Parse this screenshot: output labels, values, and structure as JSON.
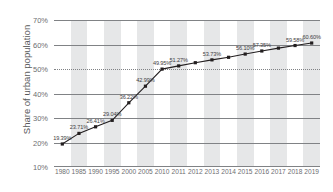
{
  "chart_data": {
    "type": "line",
    "title": "",
    "xlabel": "",
    "ylabel": "Share of urban population",
    "ylim": [
      10,
      70
    ],
    "y_ticks": [
      "10%",
      "20%",
      "30%",
      "40%",
      "50%",
      "60%",
      "70%"
    ],
    "y_tick_values": [
      10,
      20,
      30,
      40,
      50,
      60,
      70
    ],
    "grid": true,
    "legend": "none",
    "categories": [
      "1980",
      "1985",
      "1990",
      "1995",
      "2000",
      "2005",
      "2010",
      "2011",
      "2012",
      "2013",
      "2014",
      "2015",
      "2016",
      "2017",
      "2018",
      "2019"
    ],
    "values": [
      19.39,
      23.71,
      26.41,
      29.04,
      36.22,
      42.99,
      49.95,
      51.27,
      52.57,
      53.73,
      54.77,
      56.1,
      57.35,
      58.52,
      59.58,
      60.6
    ],
    "point_labels": [
      "19.39%",
      "23.71%",
      "26.41%",
      "29.04%",
      "36.22%",
      "42.99%",
      "49.95%",
      "51.27%",
      "",
      "53.73%",
      "",
      "56.10%",
      "57.35%",
      "",
      "59.58%",
      "60.60%"
    ],
    "banded_categories": [
      "1985",
      "1995",
      "2005",
      "2011",
      "2013",
      "2015",
      "2017",
      "2019"
    ],
    "colors": {
      "line": "#231f20",
      "marker": "#231f20",
      "grid": "#808285",
      "band": "#e6e7e8",
      "text": "#58595b"
    }
  }
}
